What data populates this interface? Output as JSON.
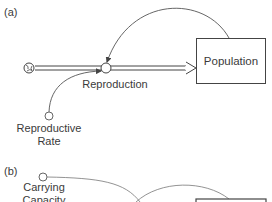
{
  "panel_a": {
    "label": "(a)",
    "stock": "Population",
    "flow": "Reproduction",
    "auxiliary_line1": "Reproductive",
    "auxiliary_line2": "Rate"
  },
  "panel_b": {
    "label": "(b)",
    "auxiliary_line1": "Carrying",
    "auxiliary_line2": "Capacity"
  },
  "colors": {
    "line": "#444444",
    "link": "#555555",
    "text": "#3a3a3a"
  }
}
